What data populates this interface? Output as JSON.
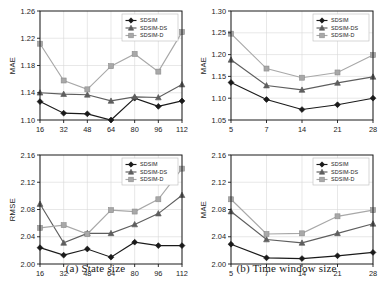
{
  "figure": {
    "panels": [
      {
        "id": "panel-a",
        "caption": "(a) State size",
        "charts": [
          "chart-a-top",
          "chart-a-bottom"
        ]
      },
      {
        "id": "panel-b",
        "caption": "(b) Time window size",
        "charts": [
          "chart-b-top",
          "chart-b-bottom"
        ]
      }
    ]
  },
  "legend_labels": {
    "sdsim": "SDSIM",
    "sdsim_ds": "SDSIM-DS",
    "sdsim_d": "SDSIM-D"
  },
  "colors": {
    "sdsim": "#1a1a1a",
    "sdsim_ds": "#5e5e5e",
    "sdsim_d": "#a8a8a8",
    "grid": "#d9d9d9",
    "axis": "#1a1a1a"
  },
  "chart_data": [
    {
      "id": "chart-a-top",
      "type": "line",
      "title": "",
      "xlabel": "",
      "ylabel": "MAE",
      "categories": [
        "16",
        "32",
        "48",
        "64",
        "80",
        "96",
        "112"
      ],
      "x": [
        16,
        32,
        48,
        64,
        80,
        96,
        112
      ],
      "xlim": [
        16,
        112
      ],
      "ylim": [
        1.1,
        1.26
      ],
      "yticks": [
        "1.10",
        "1.14",
        "1.18",
        "1.22",
        "1.26"
      ],
      "ytick_values": [
        1.1,
        1.14,
        1.18,
        1.22,
        1.26
      ],
      "grid": "vertical",
      "legend_position": "top-right",
      "series": [
        {
          "name": "SDSIM",
          "marker": "diamond",
          "values": [
            1.127,
            1.11,
            1.109,
            1.1,
            1.132,
            1.12,
            1.128
          ]
        },
        {
          "name": "SDSIM-DS",
          "marker": "triangle",
          "values": [
            1.14,
            1.138,
            1.137,
            1.128,
            1.134,
            1.133,
            1.152
          ]
        },
        {
          "name": "SDSIM-D",
          "marker": "square",
          "values": [
            1.212,
            1.158,
            1.145,
            1.179,
            1.197,
            1.171,
            1.229
          ]
        }
      ]
    },
    {
      "id": "chart-a-bottom",
      "type": "line",
      "title": "",
      "xlabel": "",
      "ylabel": "RMSE",
      "categories": [
        "16",
        "32",
        "48",
        "64",
        "80",
        "96",
        "112"
      ],
      "x": [
        16,
        32,
        48,
        64,
        80,
        96,
        112
      ],
      "xlim": [
        16,
        112
      ],
      "ylim": [
        2.0,
        2.16
      ],
      "yticks": [
        "2.00",
        "2.04",
        "2.08",
        "2.12",
        "2.16"
      ],
      "ytick_values": [
        2.0,
        2.04,
        2.08,
        2.12,
        2.16
      ],
      "grid": "vertical",
      "legend_position": "top-right",
      "series": [
        {
          "name": "SDSIM",
          "marker": "diamond",
          "values": [
            2.024,
            2.013,
            2.022,
            2.01,
            2.032,
            2.027,
            2.027
          ]
        },
        {
          "name": "SDSIM-DS",
          "marker": "triangle",
          "values": [
            2.088,
            2.031,
            2.045,
            2.045,
            2.058,
            2.074,
            2.101
          ]
        },
        {
          "name": "SDSIM-D",
          "marker": "square",
          "values": [
            2.053,
            2.057,
            2.044,
            2.079,
            2.077,
            2.095,
            2.14
          ]
        }
      ]
    },
    {
      "id": "chart-b-top",
      "type": "line",
      "title": "",
      "xlabel": "",
      "ylabel": "MAE",
      "categories": [
        "5",
        "7",
        "14",
        "21",
        "28"
      ],
      "x": [
        5,
        7,
        14,
        21,
        28
      ],
      "xlim": [
        5,
        28
      ],
      "ylim": [
        1.05,
        1.3
      ],
      "yticks": [
        "1.05",
        "1.10",
        "1.15",
        "1.20",
        "1.25",
        "1.30"
      ],
      "ytick_values": [
        1.05,
        1.1,
        1.15,
        1.2,
        1.25,
        1.3
      ],
      "grid": "vertical",
      "legend_position": "top-right",
      "series": [
        {
          "name": "SDSIM",
          "marker": "diamond",
          "values": [
            1.136,
            1.097,
            1.074,
            1.085,
            1.1
          ]
        },
        {
          "name": "SDSIM-DS",
          "marker": "triangle",
          "values": [
            1.188,
            1.129,
            1.119,
            1.135,
            1.149
          ]
        },
        {
          "name": "SDSIM-D",
          "marker": "square",
          "values": [
            1.248,
            1.168,
            1.147,
            1.159,
            1.199
          ]
        }
      ]
    },
    {
      "id": "chart-b-bottom",
      "type": "line",
      "title": "",
      "xlabel": "",
      "ylabel": "MAE",
      "categories": [
        "5",
        "7",
        "14",
        "21",
        "28"
      ],
      "x": [
        5,
        7,
        14,
        21,
        28
      ],
      "xlim": [
        5,
        28
      ],
      "ylim": [
        2.0,
        2.16
      ],
      "yticks": [
        "2.00",
        "2.04",
        "2.08",
        "2.12",
        "2.16"
      ],
      "ytick_values": [
        2.0,
        2.04,
        2.08,
        2.12,
        2.16
      ],
      "grid": "vertical",
      "legend_position": "top-right",
      "series": [
        {
          "name": "SDSIM",
          "marker": "diamond",
          "values": [
            2.029,
            2.009,
            2.008,
            2.012,
            2.017
          ]
        },
        {
          "name": "SDSIM-DS",
          "marker": "triangle",
          "values": [
            2.077,
            2.036,
            2.031,
            2.045,
            2.059
          ]
        },
        {
          "name": "SDSIM-D",
          "marker": "square",
          "values": [
            2.095,
            2.044,
            2.045,
            2.07,
            2.079
          ]
        }
      ]
    }
  ]
}
